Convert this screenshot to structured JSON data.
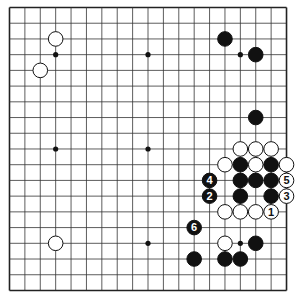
{
  "board": {
    "size": 19,
    "origin": {
      "x": 9.5,
      "y": 7.5
    },
    "spacing": {
      "x": 15.39,
      "y": 15.72
    },
    "line_color": "#333333",
    "border_color": "#222222",
    "star_points": [
      [
        3,
        3
      ],
      [
        9,
        3
      ],
      [
        15,
        3
      ],
      [
        3,
        9
      ],
      [
        9,
        9
      ],
      [
        15,
        9
      ],
      [
        3,
        15
      ],
      [
        9,
        15
      ],
      [
        15,
        15
      ]
    ]
  },
  "stones": [
    {
      "color": "white",
      "col": 3,
      "row": 2,
      "label": ""
    },
    {
      "color": "white",
      "col": 2,
      "row": 4,
      "label": ""
    },
    {
      "color": "white",
      "col": 3,
      "row": 15,
      "label": ""
    },
    {
      "color": "black",
      "col": 14,
      "row": 2,
      "label": ""
    },
    {
      "color": "black",
      "col": 16,
      "row": 3,
      "label": ""
    },
    {
      "color": "black",
      "col": 16,
      "row": 7,
      "label": ""
    },
    {
      "color": "white",
      "col": 15,
      "row": 9,
      "label": ""
    },
    {
      "color": "white",
      "col": 16,
      "row": 9,
      "label": ""
    },
    {
      "color": "white",
      "col": 17,
      "row": 9,
      "label": ""
    },
    {
      "color": "white",
      "col": 14,
      "row": 10,
      "label": ""
    },
    {
      "color": "black",
      "col": 15,
      "row": 10,
      "label": ""
    },
    {
      "color": "white",
      "col": 16,
      "row": 10,
      "label": ""
    },
    {
      "color": "black",
      "col": 17,
      "row": 10,
      "label": ""
    },
    {
      "color": "white",
      "col": 18,
      "row": 10,
      "label": ""
    },
    {
      "color": "black",
      "col": 13,
      "row": 11,
      "label": "4"
    },
    {
      "color": "black",
      "col": 15,
      "row": 11,
      "label": ""
    },
    {
      "color": "black",
      "col": 16,
      "row": 11,
      "label": ""
    },
    {
      "color": "black",
      "col": 17,
      "row": 11,
      "label": ""
    },
    {
      "color": "white",
      "col": 18,
      "row": 11,
      "label": "5"
    },
    {
      "color": "black",
      "col": 13,
      "row": 12,
      "label": "2"
    },
    {
      "color": "black",
      "col": 15,
      "row": 12,
      "label": ""
    },
    {
      "color": "black",
      "col": 17,
      "row": 12,
      "label": ""
    },
    {
      "color": "white",
      "col": 18,
      "row": 12,
      "label": "3"
    },
    {
      "color": "white",
      "col": 14,
      "row": 13,
      "label": ""
    },
    {
      "color": "white",
      "col": 15,
      "row": 13,
      "label": ""
    },
    {
      "color": "white",
      "col": 16,
      "row": 13,
      "label": ""
    },
    {
      "color": "white",
      "col": 17,
      "row": 13,
      "label": "1"
    },
    {
      "color": "black",
      "col": 12,
      "row": 14,
      "label": "6"
    },
    {
      "color": "white",
      "col": 14,
      "row": 15,
      "label": ""
    },
    {
      "color": "black",
      "col": 16,
      "row": 15,
      "label": ""
    },
    {
      "color": "black",
      "col": 12,
      "row": 16,
      "label": ""
    },
    {
      "color": "black",
      "col": 14,
      "row": 16,
      "label": ""
    },
    {
      "color": "black",
      "col": 15,
      "row": 16,
      "label": ""
    }
  ]
}
